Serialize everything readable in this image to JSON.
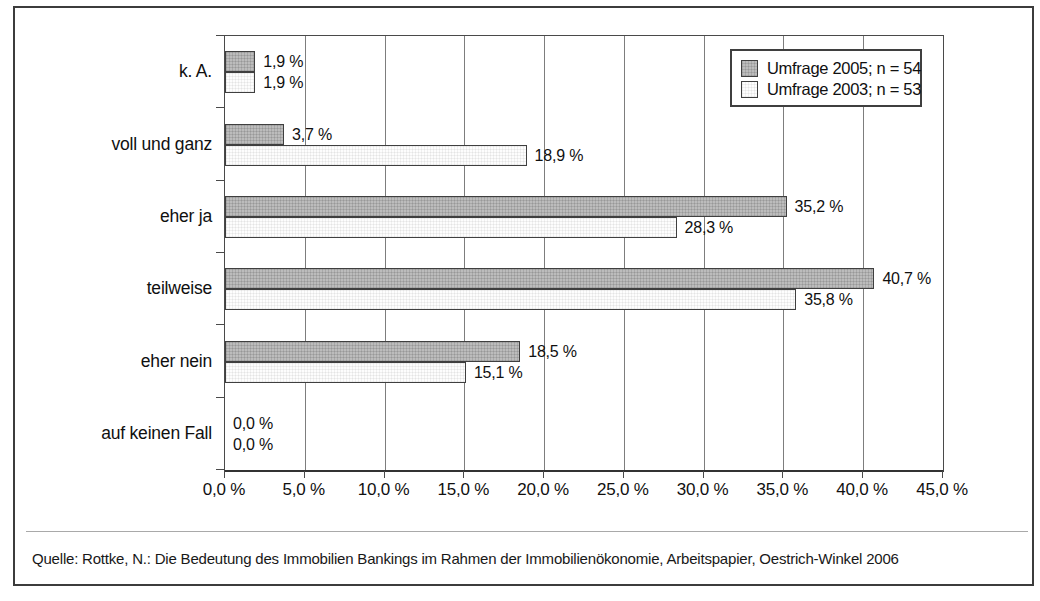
{
  "chart_data": {
    "type": "bar",
    "orientation": "horizontal",
    "title": "",
    "categories": [
      "k. A.",
      "voll und ganz",
      "eher ja",
      "teilweise",
      "eher nein",
      "auf keinen Fall"
    ],
    "series": [
      {
        "name": "Umfrage 2005; n = 54",
        "color": "#bcbcbc",
        "values": [
          1.9,
          3.7,
          35.2,
          40.7,
          18.5,
          0.0
        ],
        "value_labels": [
          "1,9 %",
          "3,7 %",
          "35,2 %",
          "40,7 %",
          "18,5 %",
          "0,0 %"
        ]
      },
      {
        "name": "Umfrage 2003; n = 53",
        "color": "#fdfdfd",
        "values": [
          1.9,
          18.9,
          28.3,
          35.8,
          15.1,
          0.0
        ],
        "value_labels": [
          "1,9 %",
          "18,9 %",
          "28,3 %",
          "35,8 %",
          "15,1 %",
          "0,0 %"
        ]
      }
    ],
    "xlim": [
      0,
      45
    ],
    "x_tick_step": 5,
    "x_tick_labels": [
      "0,0 %",
      "5,0 %",
      "10,0 %",
      "15,0 %",
      "20,0 %",
      "25,0 %",
      "30,0 %",
      "35,0 %",
      "40,0 %",
      "45,0 %"
    ],
    "grid": "vertical",
    "legend_position": "top-right",
    "xlabel": "",
    "ylabel": ""
  },
  "source_note": "Quelle: Rottke, N.: Die Bedeutung des Immobilien Bankings im Rahmen der Immobilienökonomie, Arbeitspapier, Oestrich-Winkel 2006",
  "colors": {
    "frame_border": "#3c3c3c",
    "plot_border": "#4a4a4a",
    "gridline": "#7d7d7d",
    "bar_2005": "#bcbcbc",
    "bar_2003": "#fdfdfd",
    "separator": "#a9a9a9"
  }
}
